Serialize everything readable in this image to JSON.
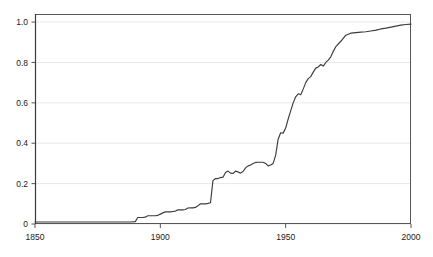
{
  "chart_data": {
    "type": "line",
    "title": "",
    "subtitle": "",
    "xlabel": "",
    "ylabel": "",
    "xlim": [
      1850,
      2000
    ],
    "ylim": [
      0,
      1.04
    ],
    "grid": "horizontal",
    "legend": "none",
    "line_color": "#3c3c3c",
    "grid_color": "#e8e8e8",
    "axis_color": "#555555",
    "background": "#ffffff",
    "xticks": [
      1850,
      1900,
      1950,
      2000
    ],
    "xtick_labels": [
      "1850",
      "1900",
      "1950",
      "2000"
    ],
    "yticks": [
      0,
      0.2,
      0.4,
      0.6,
      0.8,
      1.0
    ],
    "ytick_labels": [
      "0",
      "0.2",
      "0.4",
      "0.6",
      "0.8",
      "1.0"
    ],
    "series": [
      {
        "name": "cumulative fraction",
        "x": [
          1850,
          1860,
          1870,
          1880,
          1885,
          1888,
          1890,
          1891,
          1892,
          1893,
          1894,
          1895,
          1896,
          1897,
          1898,
          1899,
          1900,
          1901,
          1902,
          1903,
          1904,
          1905,
          1906,
          1907,
          1908,
          1909,
          1910,
          1911,
          1912,
          1913,
          1914,
          1915,
          1916,
          1917,
          1918,
          1919,
          1920,
          1921,
          1922,
          1923,
          1924,
          1925,
          1926,
          1927,
          1928,
          1929,
          1930,
          1931,
          1932,
          1933,
          1934,
          1935,
          1936,
          1937,
          1938,
          1939,
          1940,
          1941,
          1942,
          1943,
          1944,
          1945,
          1946,
          1947,
          1948,
          1949,
          1950,
          1951,
          1952,
          1953,
          1954,
          1955,
          1956,
          1957,
          1958,
          1959,
          1960,
          1961,
          1962,
          1963,
          1964,
          1965,
          1966,
          1967,
          1968,
          1969,
          1970,
          1972,
          1974,
          1976,
          1978,
          1980,
          1982,
          1984,
          1986,
          1988,
          1990,
          1992,
          1994,
          1996,
          1998,
          2000
        ],
        "y": [
          0.01,
          0.01,
          0.01,
          0.01,
          0.01,
          0.01,
          0.012,
          0.032,
          0.032,
          0.032,
          0.034,
          0.041,
          0.041,
          0.041,
          0.041,
          0.043,
          0.049,
          0.055,
          0.06,
          0.06,
          0.06,
          0.062,
          0.064,
          0.07,
          0.07,
          0.07,
          0.072,
          0.079,
          0.08,
          0.08,
          0.082,
          0.09,
          0.1,
          0.1,
          0.1,
          0.102,
          0.105,
          0.215,
          0.225,
          0.225,
          0.23,
          0.232,
          0.255,
          0.262,
          0.252,
          0.25,
          0.262,
          0.258,
          0.252,
          0.26,
          0.278,
          0.288,
          0.292,
          0.3,
          0.305,
          0.306,
          0.306,
          0.306,
          0.3,
          0.288,
          0.292,
          0.3,
          0.34,
          0.42,
          0.452,
          0.45,
          0.475,
          0.52,
          0.56,
          0.6,
          0.63,
          0.645,
          0.64,
          0.668,
          0.7,
          0.72,
          0.73,
          0.752,
          0.772,
          0.778,
          0.79,
          0.782,
          0.8,
          0.812,
          0.828,
          0.855,
          0.878,
          0.905,
          0.935,
          0.945,
          0.948,
          0.95,
          0.952,
          0.956,
          0.96,
          0.966,
          0.97,
          0.975,
          0.98,
          0.985,
          0.988,
          0.99
        ]
      }
    ]
  },
  "axes": {
    "plot_left_px": 35,
    "plot_right_px": 411,
    "plot_top_px": 14,
    "plot_bottom_px": 224
  }
}
